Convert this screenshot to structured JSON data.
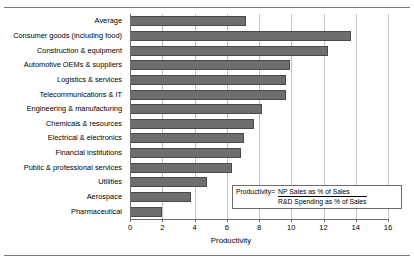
{
  "chart_data": {
    "type": "bar",
    "orientation": "horizontal",
    "title": "",
    "xlabel": "Productivity",
    "ylabel": "",
    "xlim": [
      0,
      16
    ],
    "xticks": [
      0,
      2,
      4,
      6,
      8,
      10,
      12,
      14,
      16
    ],
    "grid": true,
    "legend_position": "inside-lower-right",
    "categories": [
      "Average",
      "Consumer goods (including food)",
      "Construction & equipment",
      "Automotive OEMs & suppliers",
      "Logistics & services",
      "Telecommunications & IT",
      "Engineering & manufacturing",
      "Chemicals & resources",
      "Electrical & electronics",
      "Financial institutions",
      "Public & professional services",
      "Utilities",
      "Aerospace",
      "Pharmaceutical"
    ],
    "values": [
      7.2,
      13.7,
      12.3,
      9.9,
      9.7,
      9.7,
      8.2,
      7.7,
      7.1,
      6.9,
      6.3,
      4.8,
      3.8,
      2.0
    ],
    "series": [
      {
        "name": "Productivity",
        "values": [
          7.2,
          13.7,
          12.3,
          9.9,
          9.7,
          9.7,
          8.2,
          7.7,
          7.1,
          6.9,
          6.3,
          4.8,
          3.8,
          2.0
        ]
      }
    ],
    "bar_color": "#6e6e6e",
    "annotations": [
      {
        "label": "Productivity=",
        "numerator": "NP Sales as % of Sales",
        "denominator": "R&D Spending as % of Sales"
      }
    ]
  },
  "legend": {
    "label": "Productivity=",
    "numerator": "NP Sales as % of Sales",
    "denominator": "R&D Spending as % of Sales"
  },
  "axis": {
    "x_title": "Productivity"
  }
}
